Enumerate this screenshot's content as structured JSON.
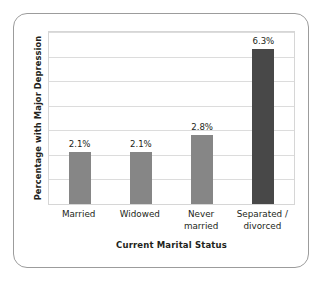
{
  "chart_data": {
    "type": "bar",
    "title": "",
    "xlabel": "Current Marital Status",
    "ylabel": "Percentage with Major Depression",
    "categories": [
      "Married",
      "Widowed",
      "Never married",
      "Separated / divorced"
    ],
    "category_lines": [
      [
        "Married"
      ],
      [
        "Widowed"
      ],
      [
        "Never",
        "married"
      ],
      [
        "Separated /",
        "divorced"
      ]
    ],
    "values": [
      2.1,
      2.1,
      2.8,
      6.3
    ],
    "data_labels": [
      "2.1%",
      "2.1%",
      "2.8%",
      "6.3%"
    ],
    "ylim": [
      0,
      7.0
    ],
    "grid": true,
    "gridline_count": 7,
    "legend": "none",
    "bar_colors": [
      "#868686",
      "#868686",
      "#868686",
      "#484848"
    ],
    "gridline_color": "#dcdcdc",
    "frame_color": "#9c9c9c",
    "text_color": "#231f20"
  }
}
